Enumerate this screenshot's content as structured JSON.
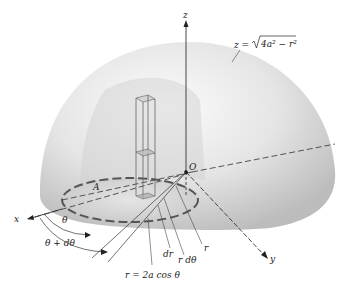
{
  "diagram": {
    "type": "hemisphere-volume-integration",
    "labels": {
      "z_axis": "z",
      "x_axis": "x",
      "y_axis": "y",
      "origin": "O",
      "region": "A",
      "surface_eq_lhs": "z = ",
      "surface_eq_rad": "4a² − r²",
      "theta": "θ",
      "theta_dtheta": "θ + dθ",
      "dr": "dr",
      "r_dtheta": "r dθ",
      "r": "r",
      "boundary_eq": "r = 2a cos θ"
    },
    "colors": {
      "hemisphere_light": "#f2f2f2",
      "hemisphere_dark": "#b8b8b8",
      "region_fill": "#d9d9d9",
      "dashed_circle": "#555555",
      "lines": "#333333"
    }
  }
}
